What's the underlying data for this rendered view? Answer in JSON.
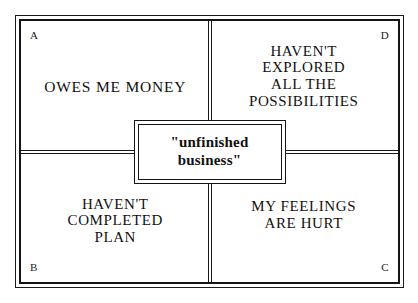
{
  "diagram": {
    "type": "2x2-quadrant-matrix",
    "center": {
      "label": "\"unfinished\nbusiness\""
    },
    "quadrants": [
      {
        "position": "top-left",
        "corner_letter": "A",
        "label": "OWES ME MONEY"
      },
      {
        "position": "top-right",
        "corner_letter": "D",
        "label": "HAVEN'T\nEXPLORED\nALL THE\nPOSSIBILITIES"
      },
      {
        "position": "bottom-left",
        "corner_letter": "B",
        "label": "HAVEN'T\nCOMPLETED\nPLAN"
      },
      {
        "position": "bottom-right",
        "corner_letter": "C",
        "label": "MY FEELINGS\nARE HURT"
      }
    ],
    "colors": {
      "background": "#ffffff",
      "line": "#151515",
      "text": "#111111"
    }
  }
}
